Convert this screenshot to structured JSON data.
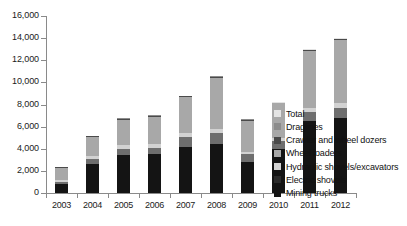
{
  "chart_data": {
    "type": "bar",
    "stacked": true,
    "title": "",
    "subtitle": "",
    "xlabel": "",
    "ylabel": "",
    "grid": false,
    "legend_position": "right",
    "categories": [
      "2003",
      "2004",
      "2005",
      "2006",
      "2007",
      "2008",
      "2009",
      "2010",
      "2011",
      "2012"
    ],
    "ylim": [
      0,
      16000
    ],
    "yticks": [
      0,
      2000,
      4000,
      6000,
      8000,
      10000,
      12000,
      14000,
      16000
    ],
    "ytick_labels": [
      "0",
      "2,000",
      "4,000",
      "6,000",
      "8,000",
      "10,000",
      "12,000",
      "14,000",
      "16,000"
    ],
    "series": [
      {
        "name": "Mining trucks",
        "color": "#141414",
        "values": [
          800,
          2600,
          3400,
          3500,
          4200,
          4400,
          2800,
          4000,
          6500,
          6800
        ]
      },
      {
        "name": "Electric shovels",
        "color": "#6e6e6e",
        "values": [
          200,
          500,
          600,
          600,
          900,
          1000,
          700,
          700,
          800,
          900
        ]
      },
      {
        "name": "Hydraulic shovels/excavators",
        "color": "#d2d2d2",
        "values": [
          150,
          250,
          300,
          300,
          350,
          400,
          250,
          300,
          400,
          450
        ]
      },
      {
        "name": "Wheel loaders",
        "color": "#a8a8a8",
        "values": [
          1100,
          1700,
          2300,
          2500,
          3200,
          4600,
          2800,
          3100,
          5100,
          5700
        ]
      },
      {
        "name": "Crawler and wheel dozers",
        "color": "#4a4a4a",
        "values": [
          80,
          80,
          100,
          100,
          80,
          100,
          80,
          50,
          100,
          80
        ]
      },
      {
        "name": "Draglines",
        "color": "#8c8c8c",
        "values": [
          40,
          40,
          50,
          50,
          40,
          50,
          40,
          30,
          50,
          40
        ]
      },
      {
        "name": "Total",
        "color": "#e4e4e4",
        "values": [
          30,
          30,
          50,
          50,
          30,
          50,
          30,
          20,
          50,
          30
        ]
      }
    ],
    "totals": [
      2400,
      5200,
      6800,
      7100,
      8800,
      10600,
      6700,
      8200,
      13000,
      14000
    ]
  },
  "legend": {
    "items": [
      {
        "label": "Total",
        "color": "#e4e4e4"
      },
      {
        "label": "Draglines",
        "color": "#8c8c8c"
      },
      {
        "label": "Crawler and wheel dozers",
        "color": "#4a4a4a"
      },
      {
        "label": "Wheel loaders",
        "color": "#a8a8a8"
      },
      {
        "label": "Hydraulic shovels/excavators",
        "color": "#d2d2d2"
      },
      {
        "label": "Electric shovels",
        "color": "#2b2b2b"
      },
      {
        "label": "Mining trucks",
        "color": "#141414"
      }
    ]
  }
}
